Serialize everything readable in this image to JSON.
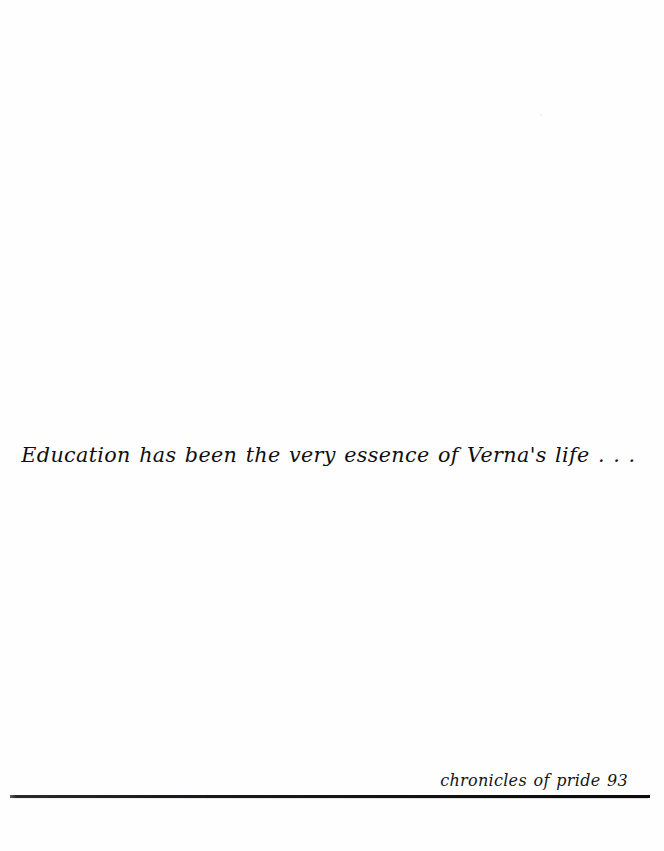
{
  "page": {
    "background_color": "#fefefe",
    "ink_color": "#100f10",
    "width": 664,
    "height": 851
  },
  "quote": {
    "text": "Education has been the very essence of Verna's life . . ."
  },
  "footer": {
    "running_foot": "chronicles of pride 93",
    "book_title": "chronicles of pride",
    "page_number": "93",
    "rule_color": "#141416"
  }
}
